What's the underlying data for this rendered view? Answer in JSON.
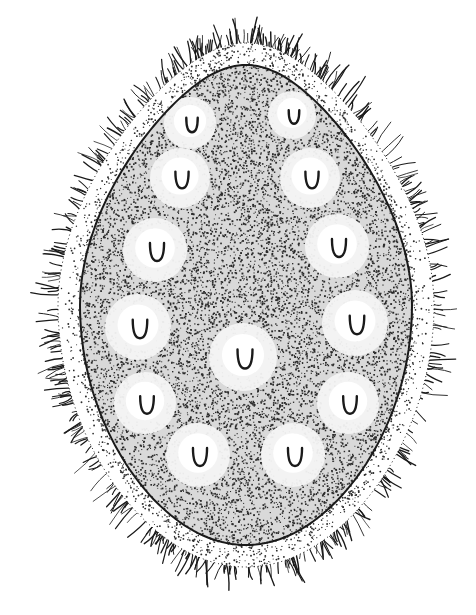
{
  "canvas": {
    "width": 476,
    "height": 615,
    "background": "#ffffff"
  },
  "colors": {
    "ink": "#1a1a1a",
    "stipple": "#2b2b2b",
    "spot_fill": "#f4f4f4",
    "body_fill": "#d9d9d9"
  },
  "body": {
    "cx": 246,
    "cy": 305,
    "outer_rx": 188,
    "outer_ry": 262,
    "inner_rx": 166,
    "inner_ry": 240,
    "top_taper": 0.72,
    "cilia_count": 420,
    "cilia_len_min": 10,
    "cilia_len_max": 26,
    "stipple_count": 9000,
    "membrane_stipple_count": 1400
  },
  "spots": [
    {
      "x": 190,
      "y": 123,
      "r": 26
    },
    {
      "x": 292,
      "y": 115,
      "r": 24
    },
    {
      "x": 180,
      "y": 178,
      "r": 30
    },
    {
      "x": 310,
      "y": 178,
      "r": 30
    },
    {
      "x": 155,
      "y": 250,
      "r": 32
    },
    {
      "x": 337,
      "y": 246,
      "r": 32
    },
    {
      "x": 138,
      "y": 327,
      "r": 33
    },
    {
      "x": 355,
      "y": 323,
      "r": 33
    },
    {
      "x": 243,
      "y": 357,
      "r": 34
    },
    {
      "x": 145,
      "y": 403,
      "r": 31
    },
    {
      "x": 348,
      "y": 403,
      "r": 31
    },
    {
      "x": 198,
      "y": 455,
      "r": 32
    },
    {
      "x": 293,
      "y": 455,
      "r": 32
    }
  ]
}
